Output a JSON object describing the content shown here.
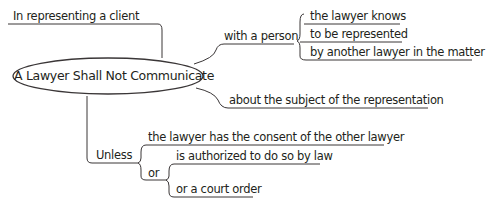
{
  "diagram": {
    "type": "mind-map",
    "root": {
      "label": "A Lawyer Shall Not Communicate"
    },
    "branches": [
      {
        "id": "context",
        "label": "In representing a client"
      },
      {
        "id": "person",
        "label": "with a person",
        "children": [
          {
            "label": "the lawyer knows"
          },
          {
            "label": "to be represented"
          },
          {
            "label": "by another lawyer in the matter"
          }
        ]
      },
      {
        "id": "subject",
        "label": "about the subject of the representation"
      },
      {
        "id": "unless",
        "label": "Unless",
        "children": [
          {
            "label": "the lawyer has the consent of the other lawyer"
          },
          {
            "label": "or",
            "children": [
              {
                "label": "is authorized to do so by law"
              },
              {
                "label": "or a court order"
              }
            ]
          }
        ]
      }
    ],
    "colors": {
      "line": "#231f20",
      "text": "#231f20",
      "background": "#ffffff"
    }
  }
}
